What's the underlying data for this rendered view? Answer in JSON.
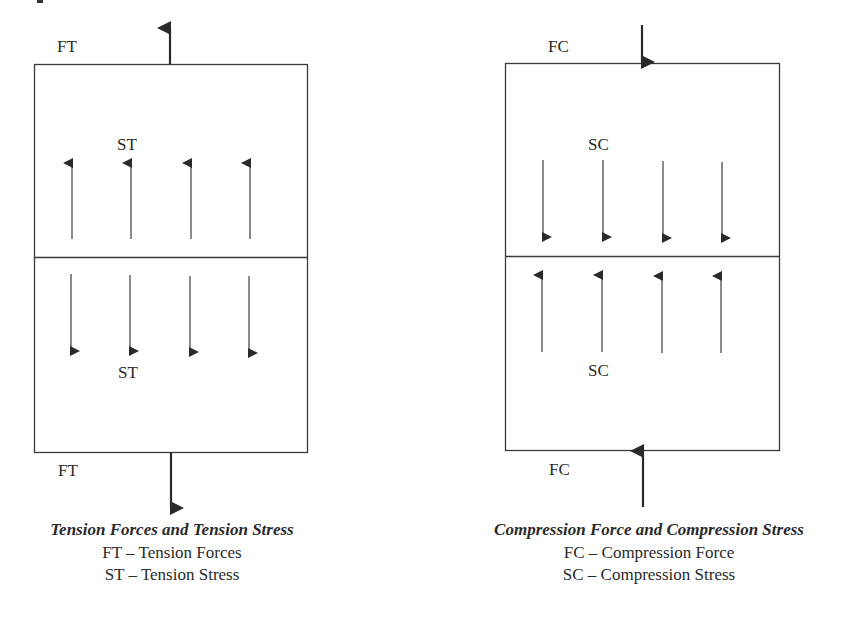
{
  "panels": [
    {
      "id": "tension",
      "top_force_label": "FT",
      "bottom_force_label": "FT",
      "upper_stress_label": "ST",
      "lower_stress_label": "ST",
      "top_force_direction": "up",
      "bottom_force_direction": "down",
      "upper_stress_direction": "up",
      "lower_stress_direction": "down",
      "caption": {
        "title": "Tension Forces and Tension Stress",
        "legend": [
          "FT – Tension Forces",
          "ST – Tension Stress"
        ]
      }
    },
    {
      "id": "compression",
      "top_force_label": "FC",
      "bottom_force_label": "FC",
      "upper_stress_label": "SC",
      "lower_stress_label": "SC",
      "top_force_direction": "down",
      "bottom_force_direction": "up",
      "upper_stress_direction": "down",
      "lower_stress_direction": "up",
      "caption": {
        "title": "Compression Force and Compression Stress",
        "legend": [
          "FC – Compression Force",
          "SC – Compression Stress"
        ]
      }
    }
  ],
  "colors": {
    "line": "#3a3a3a",
    "arrow": "#2a2a2a",
    "background": "#ffffff"
  }
}
